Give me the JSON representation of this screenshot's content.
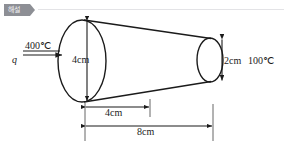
{
  "header": {
    "badge_label": "해설",
    "badge_color": "#8d8f95",
    "divider_color": "#e3e3e6"
  },
  "diagram": {
    "stroke_color": "#1b1b1b",
    "labels": {
      "heat_flux": "q",
      "hot_temperature": "400℃",
      "large_diameter": "4cm",
      "small_diameter": "2cm",
      "cold_temperature": "100℃",
      "mid_length": "4cm",
      "total_length": "8cm"
    },
    "icons": {
      "flow_arrow": "right-arrow-icon",
      "vertical_dimension_big": "double-arrow-vertical-icon",
      "vertical_dimension_small": "double-arrow-vertical-icon",
      "horizontal_dimension_mid": "double-arrow-horizontal-icon",
      "horizontal_dimension_total": "double-arrow-horizontal-icon"
    },
    "geometry": {
      "left_face_diameter_cm": 4,
      "right_face_diameter_cm": 2,
      "mid_dimension_cm": 4,
      "total_length_cm": 8,
      "hot_side_temp_c": 400,
      "cold_side_temp_c": 100
    }
  }
}
